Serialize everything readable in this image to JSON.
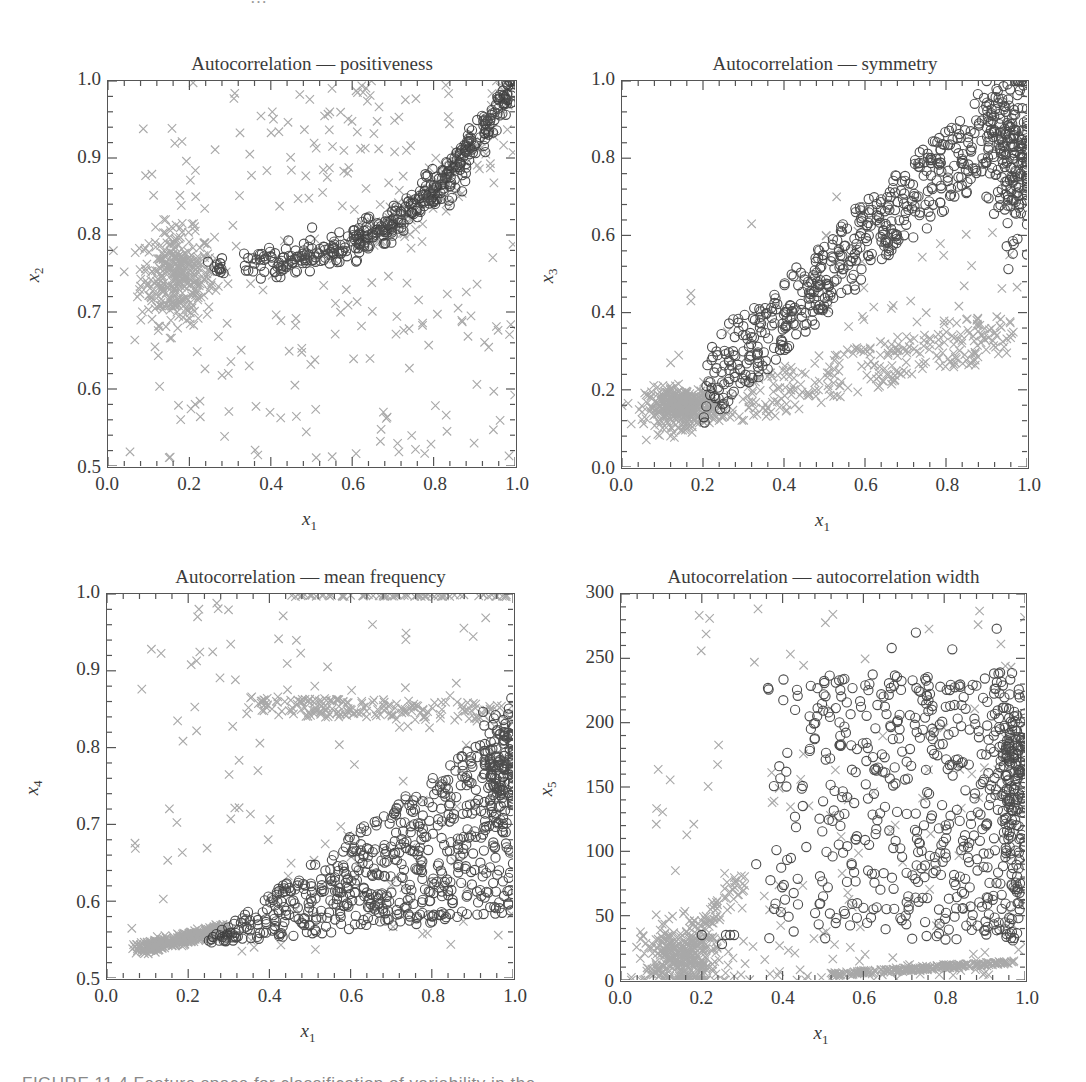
{
  "header_fragment": "…",
  "caption": "FIGURE 11.4   Feature space for classification of variability in the",
  "legend_note": "Two classes: dark open circles and light grey crosses",
  "colors": {
    "circle": "#2e2e2e",
    "cross": "#9a9a9a",
    "frame": "#555555",
    "text": "#3a3a3a"
  },
  "chart_data": [
    {
      "type": "scatter",
      "title": "Autocorrelation — positiveness",
      "xlabel": "x1",
      "ylabel": "x2",
      "xlim": [
        0.0,
        1.0
      ],
      "ylim": [
        0.5,
        1.0
      ],
      "xticks": [
        "0.0",
        "0.2",
        "0.4",
        "0.6",
        "0.8",
        "1.0"
      ],
      "yticks": [
        "0.5",
        "0.6",
        "0.7",
        "0.8",
        "0.9",
        "1.0"
      ],
      "grid": false,
      "frame": {
        "left": 107,
        "top": 80,
        "width": 410,
        "height": 388
      },
      "series": [
        {
          "name": "circles",
          "marker": "o",
          "clusters": [
            {
              "kind": "curve",
              "n": 420,
              "x0": 0.33,
              "x1": 1.0,
              "y0": 0.765,
              "y1": 1.0,
              "pow": 2.6,
              "spread": 0.012
            },
            {
              "kind": "blob",
              "n": 14,
              "cx": 0.27,
              "cy": 0.757,
              "sx": 0.012,
              "sy": 0.006
            },
            {
              "kind": "blob",
              "n": 8,
              "cx": 0.85,
              "cy": 0.86,
              "sx": 0.02,
              "sy": 0.015
            }
          ]
        },
        {
          "name": "crosses",
          "marker": "x",
          "clusters": [
            {
              "kind": "blob",
              "n": 330,
              "cx": 0.17,
              "cy": 0.745,
              "sx": 0.045,
              "sy": 0.03
            },
            {
              "kind": "uniform",
              "n": 190,
              "xmin": 0.05,
              "xmax": 1.0,
              "ymin": 0.51,
              "ymax": 1.0
            },
            {
              "kind": "curve",
              "n": 80,
              "x0": 0.6,
              "x1": 1.0,
              "y0": 0.8,
              "y1": 1.0,
              "pow": 2.0,
              "spread": 0.02
            },
            {
              "kind": "blob",
              "n": 40,
              "cx": 0.6,
              "cy": 0.93,
              "sx": 0.08,
              "sy": 0.04
            }
          ]
        }
      ]
    },
    {
      "type": "scatter",
      "title": "Autocorrelation — symmetry",
      "xlabel": "x1",
      "ylabel": "x3",
      "xlim": [
        0.0,
        1.0
      ],
      "ylim": [
        0.0,
        1.0
      ],
      "xticks": [
        "0.0",
        "0.2",
        "0.4",
        "0.6",
        "0.8",
        "1.0"
      ],
      "yticks": [
        "0.0",
        "0.2",
        "0.4",
        "0.6",
        "0.8",
        "1.0"
      ],
      "grid": false,
      "frame": {
        "left": 621,
        "top": 80,
        "width": 408,
        "height": 389
      },
      "series": [
        {
          "name": "circles",
          "marker": "o",
          "clusters": [
            {
              "kind": "band",
              "n": 560,
              "x0": 0.21,
              "x1": 1.0,
              "y0": 0.21,
              "y1": 0.97,
              "width": 0.2
            },
            {
              "kind": "blob",
              "n": 160,
              "cx": 0.96,
              "cy": 0.78,
              "sx": 0.03,
              "sy": 0.09
            }
          ]
        },
        {
          "name": "crosses",
          "marker": "x",
          "clusters": [
            {
              "kind": "blob",
              "n": 380,
              "cx": 0.15,
              "cy": 0.155,
              "sx": 0.045,
              "sy": 0.025
            },
            {
              "kind": "band",
              "n": 260,
              "x0": 0.3,
              "x1": 0.95,
              "y0": 0.17,
              "y1": 0.35,
              "width": 0.12
            },
            {
              "kind": "uniform",
              "n": 40,
              "xmin": 0.5,
              "xmax": 0.98,
              "ymin": 0.3,
              "ymax": 0.62
            },
            {
              "kind": "points",
              "pts": [
                [
                  0.32,
                  0.63
                ],
                [
                  0.53,
                  0.7
                ],
                [
                  0.17,
                  0.45
                ],
                [
                  0.17,
                  0.43
                ],
                [
                  0.26,
                  0.35
                ],
                [
                  0.14,
                  0.29
                ],
                [
                  0.12,
                  0.27
                ],
                [
                  0.06,
                  0.07
                ],
                [
                  0.12,
                  0.08
                ]
              ]
            }
          ]
        }
      ]
    },
    {
      "type": "scatter",
      "title": "Autocorrelation — mean frequency",
      "xlabel": "x1",
      "ylabel": "x4",
      "xlim": [
        0.0,
        1.0
      ],
      "ylim": [
        0.5,
        1.0
      ],
      "xticks": [
        "0.0",
        "0.2",
        "0.4",
        "0.6",
        "0.8",
        "1.0"
      ],
      "yticks": [
        "0.5",
        "0.6",
        "0.7",
        "0.8",
        "0.9",
        "1.0"
      ],
      "grid": false,
      "frame": {
        "left": 106,
        "top": 593,
        "width": 409,
        "height": 387
      },
      "series": [
        {
          "name": "circles",
          "marker": "o",
          "clusters": [
            {
              "kind": "wedge",
              "n": 620,
              "x0": 0.25,
              "x1": 1.0,
              "ylow0": 0.545,
              "ylow1": 0.58,
              "yhigh0": 0.55,
              "yhigh1": 0.84
            },
            {
              "kind": "blob",
              "n": 120,
              "cx": 0.97,
              "cy": 0.77,
              "sx": 0.025,
              "sy": 0.04
            }
          ]
        },
        {
          "name": "crosses",
          "marker": "x",
          "clusters": [
            {
              "kind": "band",
              "n": 330,
              "x0": 0.08,
              "x1": 0.3,
              "y0": 0.538,
              "y1": 0.565,
              "width": 0.015
            },
            {
              "kind": "band",
              "n": 180,
              "x0": 0.36,
              "x1": 1.0,
              "y0": 0.855,
              "y1": 0.845,
              "width": 0.025
            },
            {
              "kind": "band",
              "n": 70,
              "x0": 0.45,
              "x1": 1.0,
              "y0": 0.998,
              "y1": 0.998,
              "width": 0.003
            },
            {
              "kind": "uniform",
              "n": 110,
              "xmin": 0.06,
              "xmax": 1.0,
              "ymin": 0.53,
              "ymax": 1.0
            }
          ]
        }
      ]
    },
    {
      "type": "scatter",
      "title": "Autocorrelation — autocorrelation width",
      "xlabel": "x1",
      "ylabel": "x5",
      "xlim": [
        0.0,
        1.0
      ],
      "ylim": [
        0,
        300
      ],
      "xticks": [
        "0.0",
        "0.2",
        "0.4",
        "0.6",
        "0.8",
        "1.0"
      ],
      "yticks": [
        "0",
        "50",
        "100",
        "150",
        "200",
        "250",
        "300"
      ],
      "grid": false,
      "frame": {
        "left": 620,
        "top": 593,
        "width": 407,
        "height": 389
      },
      "series": [
        {
          "name": "circles",
          "marker": "o",
          "clusters": [
            {
              "kind": "uniform",
              "n": 520,
              "xmin": 0.33,
              "xmax": 1.0,
              "ymin": 30,
              "ymax": 240,
              "biasx": 1.6
            },
            {
              "kind": "blob",
              "n": 160,
              "cx": 0.97,
              "cy": 160,
              "sx": 0.025,
              "sy": 35
            },
            {
              "kind": "points",
              "pts": [
                [
                  0.26,
                  35
                ],
                [
                  0.27,
                  35
                ],
                [
                  0.28,
                  35
                ],
                [
                  0.25,
                  28
                ],
                [
                  0.2,
                  35
                ],
                [
                  0.67,
                  258
                ],
                [
                  0.73,
                  270
                ],
                [
                  0.93,
                  273
                ],
                [
                  0.82,
                  257
                ]
              ]
            }
          ]
        },
        {
          "name": "crosses",
          "marker": "x",
          "clusters": [
            {
              "kind": "blob",
              "n": 330,
              "cx": 0.15,
              "cy": 15,
              "sx": 0.045,
              "sy": 14
            },
            {
              "kind": "band",
              "n": 200,
              "x0": 0.52,
              "x1": 0.97,
              "y0": 4,
              "y1": 14,
              "width": 3
            },
            {
              "kind": "uniform",
              "n": 150,
              "xmin": 0.08,
              "xmax": 1.0,
              "ymin": 0,
              "ymax": 300,
              "biasy": 2.2
            },
            {
              "kind": "band",
              "n": 60,
              "x0": 0.15,
              "x1": 0.3,
              "y0": 20,
              "y1": 80,
              "width": 20
            }
          ]
        }
      ]
    }
  ]
}
